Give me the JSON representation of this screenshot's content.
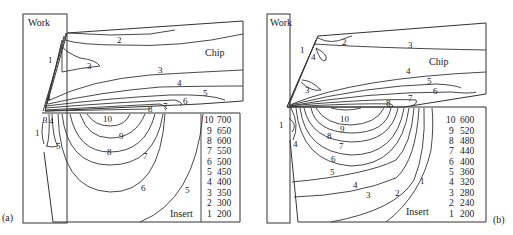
{
  "panels": [
    {
      "id": "a",
      "panel_label": "(a)",
      "region_labels": {
        "work": "Work",
        "chip": "Chip",
        "insert": "Insert"
      },
      "legend": [
        {
          "level": "10",
          "value": "700"
        },
        {
          "level": "9",
          "value": "650"
        },
        {
          "level": "8",
          "value": "600"
        },
        {
          "level": "7",
          "value": "550"
        },
        {
          "level": "6",
          "value": "500"
        },
        {
          "level": "5",
          "value": "450"
        },
        {
          "level": "4",
          "value": "400"
        },
        {
          "level": "3",
          "value": "350"
        },
        {
          "level": "2",
          "value": "300"
        },
        {
          "level": "1",
          "value": "200"
        }
      ],
      "contour_labels": {
        "c2": "2",
        "c1": "1",
        "c3a": "3",
        "c3b": "3",
        "c4": "4",
        "c5": "5",
        "c6": "6",
        "c7": "7",
        "c8": "8",
        "c10": "10",
        "c9": "9",
        "c8i": "8",
        "c7i": "7",
        "c6i": "6",
        "c5i": "5",
        "c1l": "1",
        "c3l": "3",
        "c4l": "4",
        "c5l": "5",
        "c4t": "4"
      }
    },
    {
      "id": "b",
      "panel_label": "(b)",
      "region_labels": {
        "work": "Work",
        "chip": "Chip",
        "insert": "Insert"
      },
      "legend": [
        {
          "level": "10",
          "value": "600"
        },
        {
          "level": "9",
          "value": "520"
        },
        {
          "level": "8",
          "value": "480"
        },
        {
          "level": "7",
          "value": "440"
        },
        {
          "level": "6",
          "value": "400"
        },
        {
          "level": "5",
          "value": "360"
        },
        {
          "level": "4",
          "value": "320"
        },
        {
          "level": "3",
          "value": "280"
        },
        {
          "level": "2",
          "value": "240"
        },
        {
          "level": "1",
          "value": "200"
        }
      ],
      "contour_labels": {
        "c1": "1",
        "c2": "2",
        "c3": "3",
        "c4t": "4",
        "c3m": "3",
        "c4": "4",
        "c5": "5",
        "c6": "6",
        "c7": "7",
        "c8": "8",
        "c10": "10",
        "c9": "9",
        "c8i": "8",
        "c7i": "7",
        "c6i": "6",
        "c5i": "5",
        "c4i": "4",
        "c3i": "3",
        "c2i": "2",
        "c1i": "1",
        "c1l": "1",
        "c4l": "4"
      }
    }
  ]
}
